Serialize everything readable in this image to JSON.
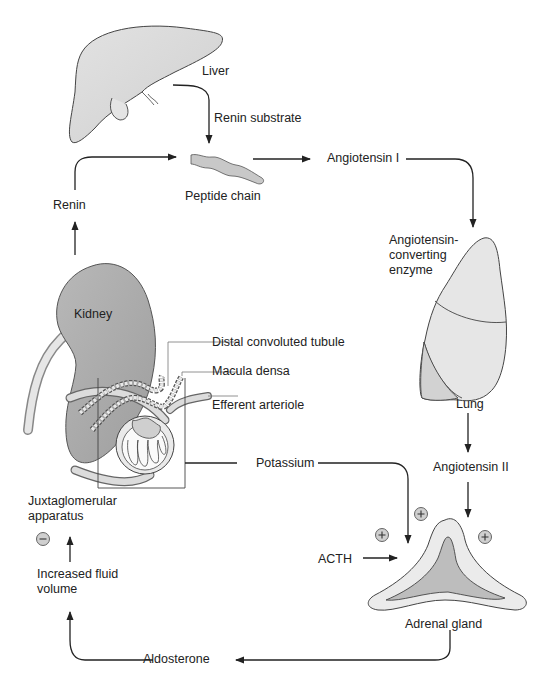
{
  "diagram": {
    "organs": {
      "liver": "Liver",
      "kidney": "Kidney",
      "lung": "Lung",
      "adrenal": "Adrenal gland"
    },
    "labels": {
      "renin_substrate": "Renin substrate",
      "peptide_chain": "Peptide chain",
      "angiotensin_1": "Angiotensin I",
      "ace": "Angiotensin-\nconverting\nenzyme",
      "angiotensin_2": "Angiotensin II",
      "renin": "Renin",
      "distal_tubule": "Distal convoluted tubule",
      "macula_densa": "Macula densa",
      "efferent_arteriole": "Efferent arteriole",
      "potassium": "Potassium",
      "acth": "ACTH",
      "jga": "Juxtaglomerular\napparatus",
      "fluid_volume": "Increased fluid\nvolume",
      "aldosterone": "Aldosterone"
    },
    "signs": {
      "plus": "+",
      "minus": "−"
    },
    "colors": {
      "organ_fill": "#d4d4d4",
      "organ_dark": "#b4b4b4",
      "line": "#2a2a2a",
      "light_fill": "#ebebeb"
    }
  }
}
